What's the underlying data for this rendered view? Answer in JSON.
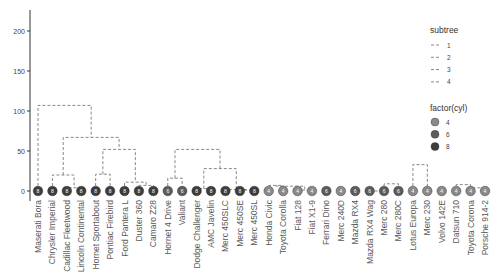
{
  "chart_data": {
    "type": "dendrogram",
    "title": "",
    "xlabel": "",
    "ylabel": "",
    "ylim": [
      0,
      220
    ],
    "yticks": [
      0,
      50,
      100,
      150,
      200
    ],
    "grid": false,
    "legend_position": "right",
    "leaves": [
      {
        "name": "Maserati Bora",
        "cyl": 8,
        "subtree": 1
      },
      {
        "name": "Chrysler Imperial",
        "cyl": 8,
        "subtree": 2
      },
      {
        "name": "Cadillac Fleetwood",
        "cyl": 8,
        "subtree": 2
      },
      {
        "name": "Lincoln Continental",
        "cyl": 8,
        "subtree": 2
      },
      {
        "name": "Hornet Sportabout",
        "cyl": 8,
        "subtree": 2
      },
      {
        "name": "Pontiac Firebird",
        "cyl": 8,
        "subtree": 2
      },
      {
        "name": "Ford Pantera L",
        "cyl": 8,
        "subtree": 2
      },
      {
        "name": "Duster 360",
        "cyl": 8,
        "subtree": 2
      },
      {
        "name": "Camaro Z28",
        "cyl": 8,
        "subtree": 2
      },
      {
        "name": "Hornet 4 Drive",
        "cyl": 6,
        "subtree": 3
      },
      {
        "name": "Valiant",
        "cyl": 6,
        "subtree": 3
      },
      {
        "name": "Dodge Challenger",
        "cyl": 8,
        "subtree": 3
      },
      {
        "name": "AMC Javelin",
        "cyl": 8,
        "subtree": 3
      },
      {
        "name": "Merc 450SLC",
        "cyl": 8,
        "subtree": 3
      },
      {
        "name": "Merc 450SE",
        "cyl": 8,
        "subtree": 3
      },
      {
        "name": "Merc 450SL",
        "cyl": 8,
        "subtree": 3
      },
      {
        "name": "Honda Civic",
        "cyl": 4,
        "subtree": 4
      },
      {
        "name": "Toyota Corolla",
        "cyl": 4,
        "subtree": 4
      },
      {
        "name": "Fiat 128",
        "cyl": 4,
        "subtree": 4
      },
      {
        "name": "Fiat X1-9",
        "cyl": 4,
        "subtree": 4
      },
      {
        "name": "Ferrari Dino",
        "cyl": 6,
        "subtree": 4
      },
      {
        "name": "Merc 240D",
        "cyl": 4,
        "subtree": 4
      },
      {
        "name": "Mazda RX4",
        "cyl": 6,
        "subtree": 4
      },
      {
        "name": "Mazda RX4 Wag",
        "cyl": 6,
        "subtree": 4
      },
      {
        "name": "Merc 280",
        "cyl": 6,
        "subtree": 4
      },
      {
        "name": "Merc 280C",
        "cyl": 6,
        "subtree": 4
      },
      {
        "name": "Lotus Europa",
        "cyl": 4,
        "subtree": 4
      },
      {
        "name": "Merc 230",
        "cyl": 4,
        "subtree": 4
      },
      {
        "name": "Volvo 142E",
        "cyl": 4,
        "subtree": 4
      },
      {
        "name": "Datsun 710",
        "cyl": 4,
        "subtree": 4
      },
      {
        "name": "Toyota Corona",
        "cyl": 4,
        "subtree": 4
      },
      {
        "name": "Porsche 914-2",
        "cyl": 4,
        "subtree": 4
      }
    ],
    "merges": [
      {
        "left": [
          2
        ],
        "right": [
          3
        ],
        "height": 4
      },
      {
        "left": [
          1
        ],
        "right": [
          2,
          3
        ],
        "height": 20
      },
      {
        "left": [
          4
        ],
        "right": [
          5
        ],
        "height": 21
      },
      {
        "left": [
          7
        ],
        "right": [
          8
        ],
        "height": 7
      },
      {
        "left": [
          6
        ],
        "right": [
          7,
          8
        ],
        "height": 11
      },
      {
        "left": [
          4,
          5
        ],
        "right": [
          6,
          7,
          8
        ],
        "height": 52
      },
      {
        "left": [
          1,
          2,
          3
        ],
        "right": [
          4,
          5,
          6,
          7,
          8
        ],
        "height": 67
      },
      {
        "left": [
          0
        ],
        "right": [
          1,
          2,
          3,
          4,
          5,
          6,
          7,
          8
        ],
        "height": 107
      },
      {
        "left": [
          9
        ],
        "right": [
          10
        ],
        "height": 16
      },
      {
        "left": [
          11
        ],
        "right": [
          12
        ],
        "height": 3
      },
      {
        "left": [
          14
        ],
        "right": [
          15
        ],
        "height": 1
      },
      {
        "left": [
          13
        ],
        "right": [
          14,
          15
        ],
        "height": 2
      },
      {
        "left": [
          11,
          12
        ],
        "right": [
          13,
          14,
          15
        ],
        "height": 28
      },
      {
        "left": [
          9,
          10
        ],
        "right": [
          11,
          12,
          13,
          14,
          15
        ],
        "height": 52
      },
      {
        "left": [
          16
        ],
        "right": [
          17
        ],
        "height": 7
      },
      {
        "left": [
          18
        ],
        "right": [
          19
        ],
        "height": 1
      },
      {
        "left": [
          16,
          17
        ],
        "right": [
          18,
          19
        ],
        "height": 6
      },
      {
        "left": [
          23
        ],
        "right": [
          24
        ],
        "height": 0
      },
      {
        "left": [
          24
        ],
        "right": [
          25
        ],
        "height": 9
      },
      {
        "left": [
          22
        ],
        "right": [
          23,
          24,
          25
        ],
        "height": 35
      },
      {
        "left": [
          26
        ],
        "right": [
          27
        ],
        "height": 33
      },
      {
        "left": [
          29
        ],
        "right": [
          30
        ],
        "height": 8
      },
      {
        "left": [
          30
        ],
        "right": [
          31
        ],
        "height": 4
      },
      {
        "left": [
          28
        ],
        "right": [
          29,
          30,
          31
        ],
        "height": 15
      },
      {
        "left": [
          27
        ],
        "right": [
          28,
          29,
          30,
          31
        ],
        "height": 23
      },
      {
        "left": [
          22,
          23,
          24,
          25
        ],
        "right": [
          26,
          27,
          28,
          29,
          30,
          31
        ],
        "height": 40
      },
      {
        "left": [
          21
        ],
        "right": [
          22,
          23,
          24,
          25,
          26,
          27,
          28,
          29,
          30,
          31
        ],
        "height": 55
      },
      {
        "left": [
          20
        ],
        "right": [
          21,
          22,
          23,
          24,
          25,
          26,
          27,
          28,
          29,
          30,
          31
        ],
        "height": 73
      },
      {
        "left": [
          16,
          17,
          18,
          19
        ],
        "right": [
          20,
          21,
          22,
          23,
          24,
          25,
          26,
          27,
          28,
          29,
          30,
          31
        ],
        "height": 73
      },
      {
        "left": [
          9,
          10,
          11,
          12,
          13,
          14,
          15
        ],
        "right": [
          16,
          17,
          18,
          19,
          20,
          21,
          22,
          23,
          24,
          25,
          26,
          27,
          28,
          29,
          30,
          31
        ],
        "height": 132
      },
      {
        "left": [
          0,
          1,
          2,
          3,
          4,
          5,
          6,
          7,
          8
        ],
        "right": [
          9,
          10,
          11,
          12,
          13,
          14,
          15,
          16,
          17,
          18,
          19,
          20,
          21,
          22,
          23,
          24,
          25,
          26,
          27,
          28,
          29,
          30,
          31
        ],
        "height": 215
      }
    ],
    "legend": {
      "subtree": {
        "title": "subtree",
        "entries": [
          "1",
          "2",
          "3",
          "4"
        ]
      },
      "cyl": {
        "title": "factor(cyl)",
        "entries": [
          "4",
          "6",
          "8"
        ]
      }
    },
    "colors": {
      "cyl_4": "#8a8a8a",
      "cyl_6": "#5c5c5c",
      "cyl_8": "#3d3d3d",
      "branch": "#7a7a7a",
      "label_subtree_1": "#b0b0b0",
      "label_default": "#5a5a5a"
    }
  }
}
